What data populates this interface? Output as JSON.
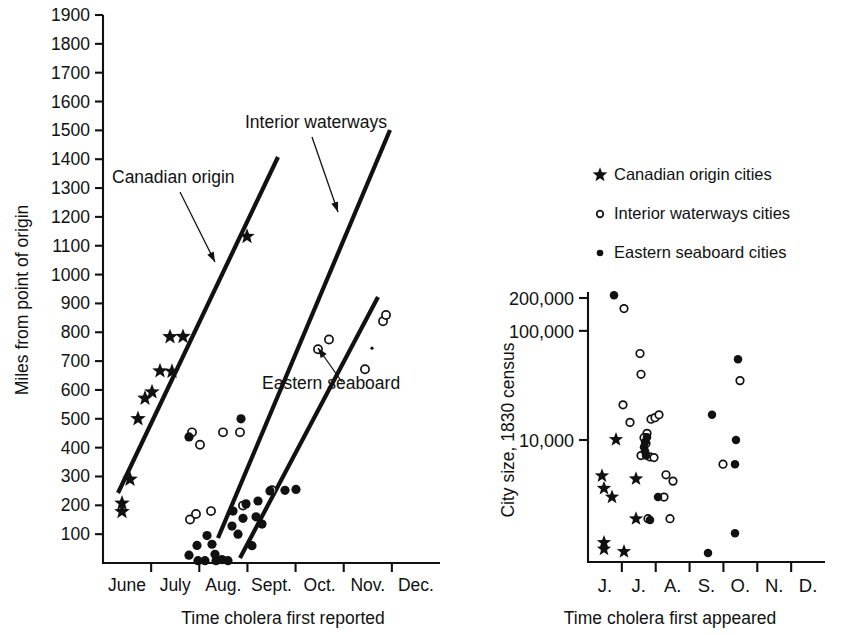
{
  "chart_data": [
    {
      "id": "left",
      "type": "scatter",
      "title": "",
      "xlabel": "Time cholera first reported",
      "ylabel": "Miles from point of origin",
      "grid": false,
      "legend_position": "none",
      "ylim": [
        0,
        1900
      ],
      "yticks": [
        100,
        200,
        300,
        400,
        500,
        600,
        700,
        800,
        900,
        1000,
        1100,
        1200,
        1300,
        1400,
        1500,
        1600,
        1700,
        1800,
        1900
      ],
      "ytick_labels": [
        "100",
        "200",
        "300",
        "400",
        "500",
        "600",
        "700",
        "800",
        "900",
        "1000",
        "1100",
        "1200",
        "1300",
        "1400",
        "1500",
        "1600",
        "1700",
        "1800",
        "1900"
      ],
      "xtick_labels": [
        "June",
        "July",
        "Aug.",
        "Sept.",
        "Oct.",
        "Nov.",
        "Dec."
      ],
      "xlim_months": [
        5.5,
        12.5
      ],
      "annotations": [
        {
          "text": "Canadian origin",
          "tx": 112,
          "ty": 183,
          "ax1": 180,
          "ay1": 192,
          "ax2": 215,
          "ay2": 262
        },
        {
          "text": "Interior waterways",
          "tx": 245,
          "ty": 128,
          "ax1": 312,
          "ay1": 137,
          "ax2": 338,
          "ay2": 212
        },
        {
          "text": "Eastern seaboard",
          "tx": 262,
          "ty": 389,
          "ax1": 342,
          "ay1": 382,
          "ax2": 318,
          "ay2": 348
        }
      ],
      "trend_lines": [
        {
          "name": "Canadian origin",
          "x1": 118,
          "y1": 493,
          "x2": 278,
          "y2": 157
        },
        {
          "name": "Interior waterways",
          "x1": 218,
          "y1": 538,
          "x2": 390,
          "y2": 130
        },
        {
          "name": "Eastern seaboard",
          "x1": 240,
          "y1": 558,
          "x2": 378,
          "y2": 297
        }
      ],
      "series": [
        {
          "name": "Canadian origin cities",
          "marker": "star",
          "points": [
            [
              122,
              178
            ],
            [
              122,
              207
            ],
            [
              130,
              290
            ],
            [
              138,
              500
            ],
            [
              145,
              571
            ],
            [
              152,
              593
            ],
            [
              160,
              666
            ],
            [
              172,
              664
            ],
            [
              170,
              784
            ],
            [
              183,
              785
            ],
            [
              247,
              1132
            ]
          ]
        },
        {
          "name": "Interior waterways cities",
          "marker": "open-circle",
          "points": [
            [
              192,
              453
            ],
            [
              190,
              151
            ],
            [
              196,
              170
            ],
            [
              200,
              410
            ],
            [
              211,
              180
            ],
            [
              223,
              453
            ],
            [
              240,
              453
            ],
            [
              243,
              199
            ],
            [
              272,
              252
            ],
            [
              318,
              741
            ],
            [
              329,
              775
            ],
            [
              365,
              672
            ],
            [
              383,
              838
            ],
            [
              386,
              860
            ]
          ]
        },
        {
          "name": "Eastern seaboard cities",
          "marker": "filled-circle",
          "points": [
            [
              189,
              437
            ],
            [
              189,
              27
            ],
            [
              197,
              61
            ],
            [
              198,
              8
            ],
            [
              205,
              8
            ],
            [
              207,
              95
            ],
            [
              212,
              65
            ],
            [
              215,
              30
            ],
            [
              216,
              8
            ],
            [
              222,
              12
            ],
            [
              228,
              8
            ],
            [
              232,
              128
            ],
            [
              233,
              180
            ],
            [
              238,
              100
            ],
            [
              241,
              500
            ],
            [
              243,
              155
            ],
            [
              246,
              205
            ],
            [
              252,
              60
            ],
            [
              256,
              160
            ],
            [
              258,
              215
            ],
            [
              262,
              135
            ],
            [
              270,
              250
            ],
            [
              285,
              252
            ],
            [
              296,
              255
            ]
          ]
        }
      ]
    },
    {
      "id": "right",
      "type": "scatter",
      "title": "",
      "xlabel": "Time cholera first appeared",
      "ylabel": "City size, 1830 census",
      "grid": false,
      "yscale": "log",
      "legend_position": "above-plot",
      "yticks": [
        10000,
        100000,
        200000
      ],
      "ytick_labels": [
        "10,000",
        "100,000",
        "200,000"
      ],
      "xtick_labels": [
        "J.",
        "J.",
        "A.",
        "S.",
        "O.",
        "N.",
        "D."
      ],
      "legend": [
        {
          "marker": "star",
          "label": "Canadian origin cities"
        },
        {
          "marker": "open-circle",
          "label": "Interior waterways cities"
        },
        {
          "marker": "filled-circle",
          "label": "Eastern seaboard cities"
        }
      ],
      "series": [
        {
          "name": "Canadian origin cities",
          "marker": "star",
          "points": [
            [
              616,
              10100
            ],
            [
              602,
              4700
            ],
            [
              604,
              3600
            ],
            [
              612,
              3000
            ],
            [
              636,
              4400
            ],
            [
              636,
              1900
            ],
            [
              604,
              1150
            ],
            [
              604,
              1000
            ],
            [
              624,
              950
            ]
          ]
        },
        {
          "name": "Interior waterways cities",
          "marker": "open-circle",
          "points": [
            [
              624,
              160000
            ],
            [
              640,
              62000
            ],
            [
              641,
              40000
            ],
            [
              623,
              21000
            ],
            [
              630,
              14500
            ],
            [
              647,
              11500
            ],
            [
              651,
              15500
            ],
            [
              655,
              16000
            ],
            [
              659,
              17000
            ],
            [
              644,
              10500
            ],
            [
              646,
              9300
            ],
            [
              641,
              7200
            ],
            [
              650,
              7000
            ],
            [
              654,
              6900
            ],
            [
              666,
              4800
            ],
            [
              673,
              4200
            ],
            [
              664,
              3000
            ],
            [
              648,
              1900
            ],
            [
              670,
              1900
            ],
            [
              740,
              35000
            ],
            [
              723,
              6000
            ]
          ]
        },
        {
          "name": "Eastern seaboard cities",
          "marker": "filled-circle",
          "points": [
            [
              614,
              212000
            ],
            [
              647,
              10600
            ],
            [
              645,
              9600
            ],
            [
              644,
              8600
            ],
            [
              645,
              7900
            ],
            [
              646,
              7200
            ],
            [
              658,
              3000
            ],
            [
              650,
              1850
            ],
            [
              712,
              17000
            ],
            [
              738,
              55000
            ],
            [
              736,
              10000
            ],
            [
              735,
              6000
            ],
            [
              735,
              1400
            ],
            [
              708,
              920
            ]
          ]
        }
      ]
    }
  ],
  "left_chart": {
    "ylabel": "Miles from point of origin",
    "xlabel": "Time cholera first reported",
    "yticks": [
      "1900",
      "1800",
      "1700",
      "1600",
      "1500",
      "1400",
      "1300",
      "1200",
      "1100",
      "1000",
      "900",
      "800",
      "700",
      "600",
      "500",
      "400",
      "300",
      "200",
      "100"
    ],
    "months": [
      "June",
      "July",
      "Aug.",
      "Sept.",
      "Oct.",
      "Nov.",
      "Dec."
    ],
    "ann_canadian": "Canadian origin",
    "ann_interior": "Interior waterways",
    "ann_eastern": "Eastern seaboard"
  },
  "right_chart": {
    "ylabel": "City size, 1830 census",
    "xlabel": "Time cholera first appeared",
    "yticks": [
      "200,000",
      "100,000",
      "10,000"
    ],
    "months": [
      "J.",
      "J.",
      "A.",
      "S.",
      "O.",
      "N.",
      "D."
    ],
    "legend_items": [
      "Canadian origin cities",
      "Interior waterways cities",
      "Eastern seaboard cities"
    ]
  },
  "colors": {
    "ink": "#111111",
    "background": "#ffffff"
  }
}
